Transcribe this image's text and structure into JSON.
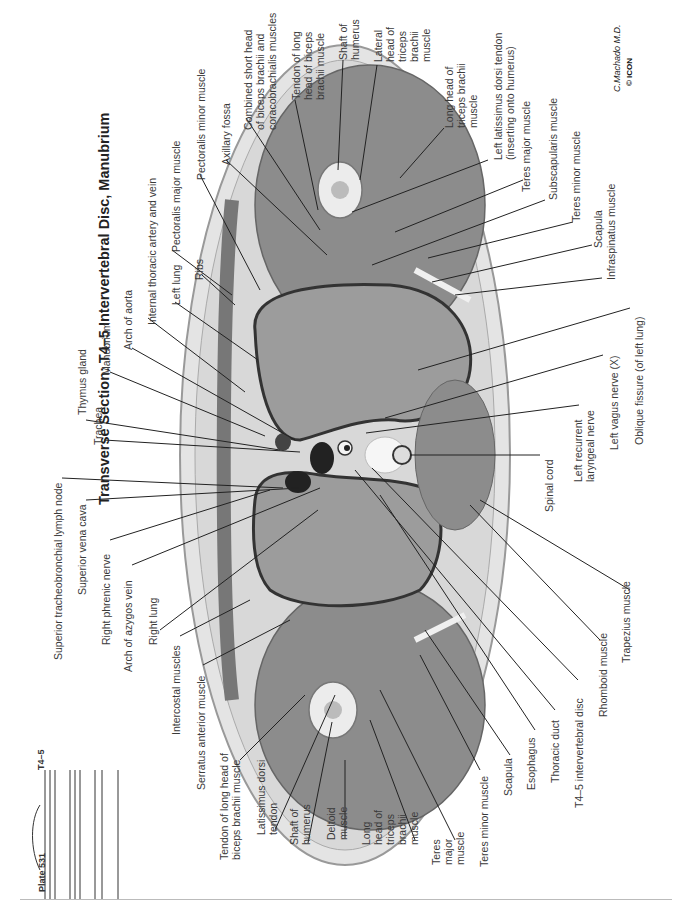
{
  "title": "Transverse Section: T4–5 Intervertebral Disc, Manubrium",
  "plate": "Plate 531",
  "level_marker": "T4–5",
  "signature": "C.Machado M.D.",
  "logo": "© ICON",
  "labels_left_top": {
    "trachea": "Trachea",
    "thymus_gland": "Thymus gland",
    "manubrium": "Manubrium",
    "arch_of_aorta": "Arch of aorta",
    "internal_thoracic": "Internal thoracic artery and vein",
    "left_lung": "Left lung",
    "ribs": "Ribs",
    "pectoralis_major": "Pectoralis major muscle",
    "pectoralis_minor": "Pectoralis minor muscle",
    "axillary_fossa": "Axillary fossa",
    "combined_short_head": [
      "Combined short head",
      "of biceps brachii and",
      "coracobrachialis muscles"
    ],
    "tendon_long_head_top": [
      "Tendon of long",
      "head of biceps",
      "brachii muscle"
    ],
    "shaft_humerus_top": [
      "Shaft of",
      "humerus"
    ],
    "lateral_head_triceps": [
      "Lateral",
      "head of",
      "triceps",
      "brachii",
      "muscle"
    ]
  },
  "labels_right_top": {
    "long_head_triceps_top": [
      "Long head of",
      "triceps brachii",
      "muscle"
    ],
    "left_latissimus": [
      "Left latissimus dorsi tendon",
      "(inserting onto humerus)"
    ],
    "teres_major_top": "Teres major muscle",
    "subscapularis": "Subscapularis muscle",
    "teres_minor_top": "Teres minor muscle",
    "scapula_top": "Scapula",
    "infraspinatus": "Infraspinatus muscle"
  },
  "labels_left_bottom": {
    "superior_tracheobronchial": "Superior tracheobronchial lymph node",
    "superior_vena_cava": "Superior vena cava",
    "right_phrenic": "Right phrenic nerve",
    "arch_azygos": "Arch of azygos vein",
    "right_lung": "Right lung",
    "intercostal": "Intercostal muscles",
    "serratus_anterior": "Serratus anterior muscle",
    "tendon_long_head_bottom": [
      "Tendon of long head of",
      "biceps brachii muscle"
    ],
    "latissimus_dorsi_tendon": [
      "Latissimus dorsi",
      "tendon"
    ],
    "shaft_humerus_bottom": [
      "Shaft of",
      "humerus"
    ],
    "deltoid": [
      "Deltoid",
      "muscle"
    ],
    "long_head_triceps_bottom": [
      "Long",
      "head of",
      "triceps",
      "brachii",
      "muscle"
    ],
    "teres_major_bottom": [
      "Teres",
      "major",
      "muscle"
    ]
  },
  "labels_right_bottom": {
    "teres_minor_bottom": "Teres minor muscle",
    "scapula_bottom": "Scapula",
    "esophagus": "Esophagus",
    "thoracic_duct": "Thoracic duct",
    "t45_disc": "T4–5 intervertebral disc",
    "rhomboid": "Rhomboid muscle",
    "trapezius": "Trapezius muscle",
    "spinal_cord": "Spinal cord",
    "left_recurrent": [
      "Left recurrent",
      "laryngeal nerve"
    ],
    "left_vagus": "Left vagus nerve (X)",
    "oblique_fissure": "Oblique fissure (of left lung)"
  },
  "colors": {
    "skin": "#e8e8e8",
    "fat": "#d6d6d6",
    "muscle": "#8e8e8e",
    "lung": "#9a9a9a",
    "vessel": "#2a2a2a",
    "bone": "#efefef",
    "leader": "#222222"
  }
}
